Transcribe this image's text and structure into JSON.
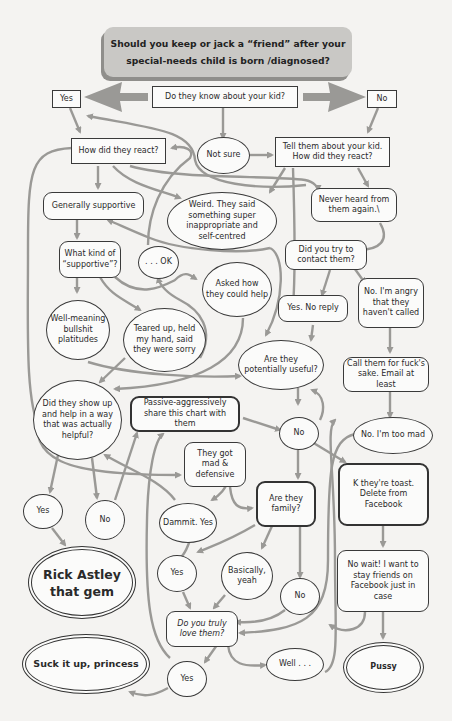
{
  "title": "Should you keep or jack a “friend” after your special-needs child is born /diagnosed?",
  "colors": {
    "background": "#f4f3f1",
    "arrow": "#9a9996",
    "title_bg": "#c9c8c5",
    "border": "#333333"
  },
  "nodes": {
    "know_kid": "Do they know about your kid?",
    "yes_top": "Yes",
    "no_top": "No",
    "not_sure": "Not sure",
    "how_react": "How did they react?",
    "tell_them": "Tell them about your kid. How did they react?",
    "gen_supportive": "Generally supportive",
    "weird": "Weird. They said something super inappropriate and self-centred",
    "never_heard": "Never heard from them again.\\",
    "what_kind": "What kind of “supportive”?",
    "ok": ". . . OK",
    "asked_help": "Asked how they could help",
    "try_contact": "Did you try to contact them?",
    "yes_no_reply": "Yes. No reply",
    "angry": "No. I'm angry that they haven't called",
    "well_meaning": "Well-meaning bullshit platitudes",
    "teared_up": "Teared up, held my hand, said they were sorry",
    "potentially_useful": "Are they potentially useful?",
    "call_them": "Call them for fuck's sake. Email at least",
    "show_up": "Did they show up and help in a way that was actually helpful?",
    "passive_aggr": "Passive-aggressively share this chart with them",
    "no_mid": "No",
    "too_mad": "No. I'm too mad",
    "mad_defensive": "They got mad & defensive",
    "toast": "K they're toast. Delete from Facebook",
    "yes_left": "Yes",
    "no_left": "No",
    "dammit": "Dammit. Yes",
    "family": "Are they family?",
    "rick": "Rick Astley that gem",
    "yes_fam": "Yes",
    "basically": "Basically, yeah",
    "no_fam": "No",
    "no_wait": "No wait! I want to stay friends on Facebook just in case",
    "truly_love": "Do you truly love them?",
    "suck_it": "Suck it up, princess",
    "yes_love": "Yes",
    "well": "Well . . .",
    "pussy": "Pussy"
  }
}
